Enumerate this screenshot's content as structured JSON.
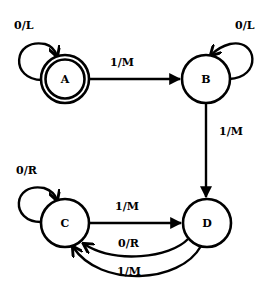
{
  "diagram": {
    "type": "finite-state-machine",
    "nodes": [
      {
        "id": "A",
        "label": "A",
        "accepting": true
      },
      {
        "id": "B",
        "label": "B",
        "accepting": false
      },
      {
        "id": "C",
        "label": "C",
        "accepting": false
      },
      {
        "id": "D",
        "label": "D",
        "accepting": false
      }
    ],
    "edges": [
      {
        "from": "A",
        "to": "A",
        "label": "0/L"
      },
      {
        "from": "A",
        "to": "B",
        "label": "1/M"
      },
      {
        "from": "B",
        "to": "B",
        "label": "0/L"
      },
      {
        "from": "B",
        "to": "D",
        "label": "1/M"
      },
      {
        "from": "C",
        "to": "C",
        "label": "0/R"
      },
      {
        "from": "C",
        "to": "D",
        "label": "1/M"
      },
      {
        "from": "D",
        "to": "C",
        "label": "0/R"
      },
      {
        "from": "D",
        "to": "C",
        "label": "1/M"
      }
    ]
  }
}
